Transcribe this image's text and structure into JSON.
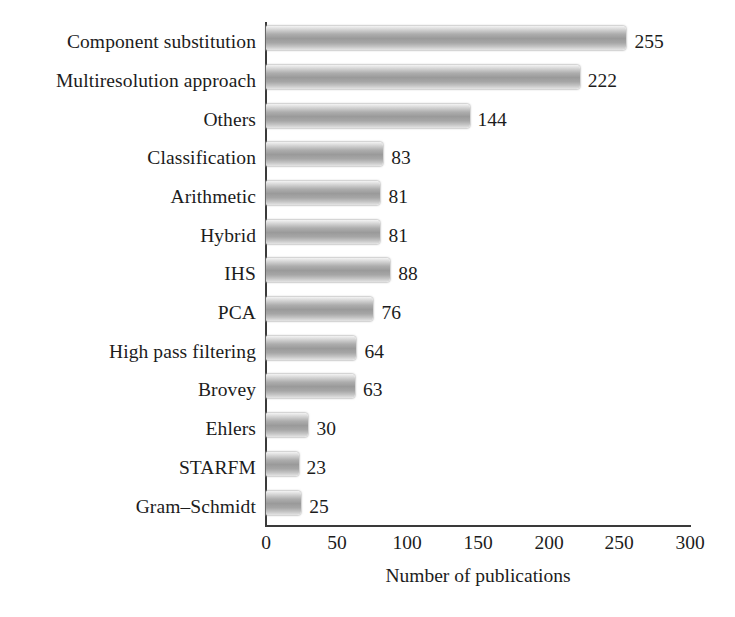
{
  "chart_data": {
    "type": "bar",
    "orientation": "horizontal",
    "title": "",
    "xlabel": "Number of publications",
    "ylabel": "",
    "xlim": [
      0,
      300
    ],
    "xticks": [
      0,
      50,
      100,
      150,
      200,
      250,
      300
    ],
    "xtick_labels": [
      "0",
      "50",
      "100",
      "150",
      "200",
      "250",
      "300"
    ],
    "grid": false,
    "legend": null,
    "bar_color": "#a8a8a8",
    "bar_style": "vertical grayscale gradient",
    "categories": [
      "Component substitution",
      "Multiresolution approach",
      "Others",
      "Classification",
      "Arithmetic",
      "Hybrid",
      "IHS",
      "PCA",
      "High pass filtering",
      "Brovey",
      "Ehlers",
      "STARFM",
      "Gram–Schmidt"
    ],
    "values": [
      255,
      222,
      144,
      83,
      81,
      81,
      88,
      76,
      64,
      63,
      30,
      23,
      25
    ],
    "value_labels": [
      "255",
      "222",
      "144",
      "83",
      "81",
      "81",
      "88",
      "76",
      "64",
      "63",
      "30",
      "23",
      "25"
    ]
  }
}
